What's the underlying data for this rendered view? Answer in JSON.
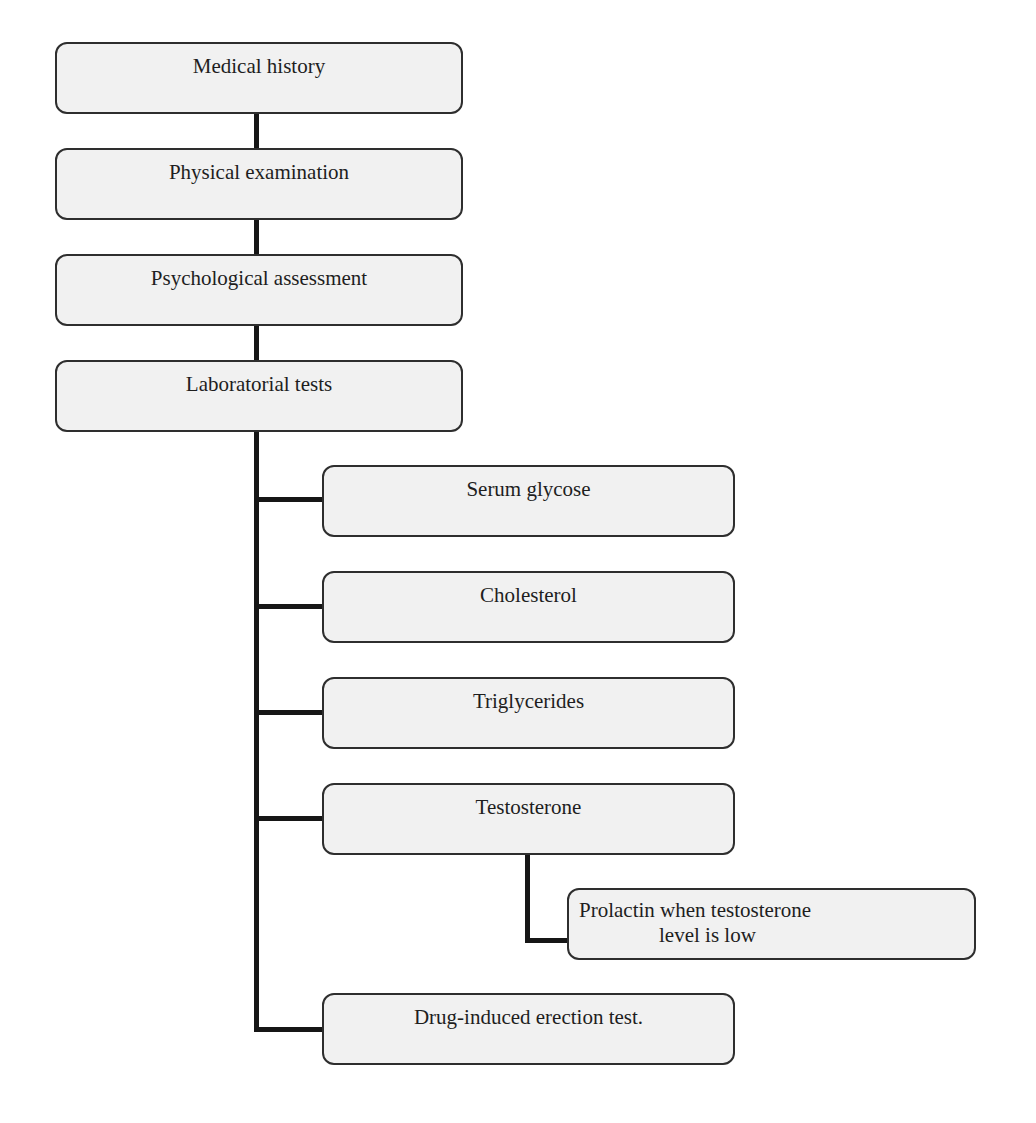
{
  "diagram": {
    "type": "flowchart",
    "colors": {
      "box_fill": "#f1f1f1",
      "box_border": "#2e2e2e",
      "connector": "#161616",
      "text": "#1e1e1e",
      "background": "#ffffff"
    },
    "main_steps": [
      {
        "id": "medical-history",
        "label": "Medical history"
      },
      {
        "id": "physical-examination",
        "label": "Physical examination"
      },
      {
        "id": "psychological-assessment",
        "label": "Psychological assessment"
      },
      {
        "id": "laboratorial-tests",
        "label": "Laboratorial tests"
      }
    ],
    "lab_tests": [
      {
        "id": "serum-glycose",
        "label": "Serum glycose"
      },
      {
        "id": "cholesterol",
        "label": "Cholesterol"
      },
      {
        "id": "triglycerides",
        "label": "Triglycerides"
      },
      {
        "id": "testosterone",
        "label": "Testosterone"
      },
      {
        "id": "drug-induced-erection-test",
        "label": "Drug-induced erection test."
      }
    ],
    "conditional": {
      "parent": "testosterone",
      "line1": "Prolactin when testosterone",
      "line2": "level is low"
    },
    "edges": [
      [
        "medical-history",
        "physical-examination"
      ],
      [
        "physical-examination",
        "psychological-assessment"
      ],
      [
        "psychological-assessment",
        "laboratorial-tests"
      ],
      [
        "laboratorial-tests",
        "serum-glycose"
      ],
      [
        "laboratorial-tests",
        "cholesterol"
      ],
      [
        "laboratorial-tests",
        "triglycerides"
      ],
      [
        "laboratorial-tests",
        "testosterone"
      ],
      [
        "testosterone",
        "prolactin"
      ],
      [
        "laboratorial-tests",
        "drug-induced-erection-test"
      ]
    ]
  }
}
